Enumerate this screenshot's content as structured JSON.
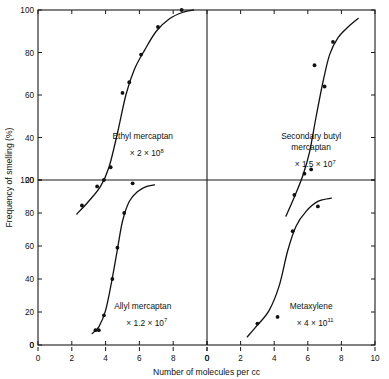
{
  "figure": {
    "x_axis_title": "Number of molecules per cc",
    "y_axis_title": "Frequency of smelling (%)",
    "x_ticks_left": [
      "0",
      "2",
      "4",
      "6",
      "8"
    ],
    "x_ticks_right": [
      "0",
      "2",
      "4",
      "6",
      "8",
      "10"
    ],
    "y_ticks_top": [
      "20",
      "40",
      "60",
      "80",
      "100"
    ],
    "y_ticks_bottom": [
      "0",
      "20",
      "40",
      "60",
      "80",
      "100"
    ],
    "multiply_symbol": "×"
  },
  "chart_data": {
    "type": "scatter",
    "title": "",
    "xlabel": "Number of molecules per cc",
    "ylabel": "Frequency of smelling (%)",
    "xlim": [
      0,
      10
    ],
    "ylim": [
      0,
      100
    ],
    "grid": false,
    "legend": "none",
    "panel_layout": "2x2",
    "panels": [
      {
        "position": "top-left",
        "name": "Ethyl mercaptan",
        "multiplier_prefix": "× 2 × 10",
        "multiplier_exponent": "8",
        "multiplier_text": "× 2 × 10⁸",
        "x_ticks": [
          0,
          2,
          4,
          6,
          8
        ],
        "y_ticks": [
          20,
          40,
          60,
          80,
          100
        ],
        "points": [
          {
            "x": 2.6,
            "y": 8
          },
          {
            "x": 3.5,
            "y": 17
          },
          {
            "x": 3.9,
            "y": 20
          },
          {
            "x": 4.3,
            "y": 26
          },
          {
            "x": 5.0,
            "y": 61
          },
          {
            "x": 5.4,
            "y": 66
          },
          {
            "x": 6.1,
            "y": 79
          },
          {
            "x": 7.1,
            "y": 92
          },
          {
            "x": 8.5,
            "y": 100
          }
        ],
        "curve": [
          {
            "x": 2.3,
            "y": 4
          },
          {
            "x": 3.0,
            "y": 10
          },
          {
            "x": 3.7,
            "y": 17
          },
          {
            "x": 4.2,
            "y": 26
          },
          {
            "x": 4.7,
            "y": 42
          },
          {
            "x": 5.2,
            "y": 60
          },
          {
            "x": 5.7,
            "y": 72
          },
          {
            "x": 6.3,
            "y": 81
          },
          {
            "x": 7.0,
            "y": 90
          },
          {
            "x": 7.8,
            "y": 96
          },
          {
            "x": 8.6,
            "y": 99
          },
          {
            "x": 9.2,
            "y": 100
          }
        ]
      },
      {
        "position": "top-right",
        "name_line1": "Secondary butyl",
        "name_line2": "mercaptan",
        "name": "Secondary butyl mercaptan",
        "multiplier_prefix": "× 1.5 × 10",
        "multiplier_exponent": "7",
        "multiplier_text": "× 1.5 × 10⁷",
        "x_ticks": [
          0,
          2,
          4,
          6,
          8,
          10
        ],
        "y_ticks": [
          20,
          40,
          60,
          80,
          100
        ],
        "points": [
          {
            "x": 5.2,
            "y": 13
          },
          {
            "x": 5.8,
            "y": 23
          },
          {
            "x": 6.2,
            "y": 25
          },
          {
            "x": 6.4,
            "y": 74
          },
          {
            "x": 7.0,
            "y": 64
          },
          {
            "x": 7.5,
            "y": 85
          }
        ],
        "curve": [
          {
            "x": 4.7,
            "y": 3
          },
          {
            "x": 5.2,
            "y": 12
          },
          {
            "x": 5.7,
            "y": 22
          },
          {
            "x": 6.1,
            "y": 33
          },
          {
            "x": 6.5,
            "y": 50
          },
          {
            "x": 6.9,
            "y": 66
          },
          {
            "x": 7.3,
            "y": 79
          },
          {
            "x": 7.8,
            "y": 87
          },
          {
            "x": 8.4,
            "y": 92
          },
          {
            "x": 9.0,
            "y": 96
          }
        ]
      },
      {
        "position": "bottom-left",
        "name": "Allyl mercaptan",
        "multiplier_prefix": "× 1.2 × 10",
        "multiplier_exponent": "7",
        "multiplier_text": "× 1.2 × 10⁷",
        "x_ticks": [
          0,
          2,
          4,
          6,
          8
        ],
        "y_ticks": [
          0,
          20,
          40,
          60,
          80,
          100
        ],
        "points": [
          {
            "x": 3.4,
            "y": 9
          },
          {
            "x": 3.6,
            "y": 9
          },
          {
            "x": 3.9,
            "y": 18
          },
          {
            "x": 4.4,
            "y": 40
          },
          {
            "x": 4.7,
            "y": 59
          },
          {
            "x": 5.1,
            "y": 80
          },
          {
            "x": 5.6,
            "y": 98
          }
        ],
        "curve": [
          {
            "x": 3.2,
            "y": 7
          },
          {
            "x": 3.6,
            "y": 11
          },
          {
            "x": 4.0,
            "y": 21
          },
          {
            "x": 4.35,
            "y": 38
          },
          {
            "x": 4.7,
            "y": 58
          },
          {
            "x": 5.0,
            "y": 75
          },
          {
            "x": 5.4,
            "y": 87
          },
          {
            "x": 5.9,
            "y": 93
          },
          {
            "x": 6.4,
            "y": 96
          },
          {
            "x": 6.9,
            "y": 97
          }
        ]
      },
      {
        "position": "bottom-right",
        "name": "Metaxylene",
        "multiplier_prefix": "× 4 × 10",
        "multiplier_exponent": "11",
        "multiplier_text": "× 4 × 10¹¹",
        "x_ticks": [
          0,
          2,
          4,
          6,
          8,
          10
        ],
        "y_ticks": [
          0,
          20,
          40,
          60,
          80,
          100
        ],
        "points": [
          {
            "x": 3.0,
            "y": 13
          },
          {
            "x": 4.2,
            "y": 17
          },
          {
            "x": 5.1,
            "y": 69
          },
          {
            "x": 6.6,
            "y": 84
          }
        ],
        "curve": [
          {
            "x": 2.4,
            "y": 5
          },
          {
            "x": 3.0,
            "y": 12
          },
          {
            "x": 3.7,
            "y": 21
          },
          {
            "x": 4.3,
            "y": 36
          },
          {
            "x": 4.8,
            "y": 57
          },
          {
            "x": 5.3,
            "y": 72
          },
          {
            "x": 5.9,
            "y": 81
          },
          {
            "x": 6.6,
            "y": 87
          },
          {
            "x": 7.4,
            "y": 89
          }
        ]
      }
    ]
  }
}
